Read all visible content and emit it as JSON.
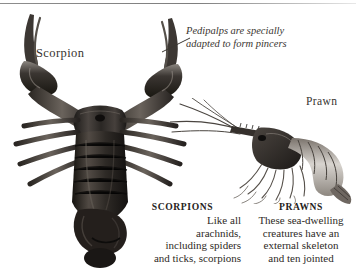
{
  "page": {
    "width": 356,
    "height": 268,
    "background_color": "#ffffff",
    "text_color": "#2e2a26",
    "rule_color": "#8d8d8d"
  },
  "labels": {
    "scorpion": "Scorpion",
    "prawn": "Prawn"
  },
  "annotation": {
    "line1": "Pedipalps are specially",
    "line2": "adapted to form pincers"
  },
  "columns": {
    "scorpions": {
      "heading": "SCORPIONS",
      "line1": "Like all",
      "line2": "arachnids,",
      "line3": "including spiders",
      "line4": "and ticks, scorpions"
    },
    "prawns": {
      "heading": "PRAWNS",
      "line1": "These sea-dwelling",
      "line2": "creatures have an",
      "line3": "external skeleton",
      "line4": "and ten jointed"
    }
  },
  "figures": {
    "scorpion": {
      "name": "scorpion-photograph",
      "description": "Dark overhead photograph of a scorpion with raised pincers, segmented abdomen and eight legs"
    },
    "prawn": {
      "name": "prawn-illustration",
      "description": "Line engraving of a prawn in side view with long antennae and curled tail"
    }
  }
}
